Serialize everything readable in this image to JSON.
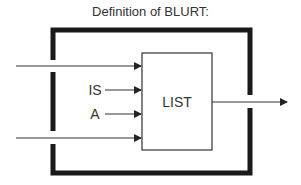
{
  "title": "Definition of BLURT:",
  "box": {
    "label": "LIST"
  },
  "inputs": [
    {
      "label": "",
      "from_outside": true
    },
    {
      "label": "IS",
      "from_outside": false
    },
    {
      "label": "A",
      "from_outside": false
    },
    {
      "label": "",
      "from_outside": true
    }
  ],
  "output": {
    "label": ""
  },
  "colors": {
    "frame": "#1a1a1a",
    "line": "#333333",
    "text": "#333333"
  }
}
